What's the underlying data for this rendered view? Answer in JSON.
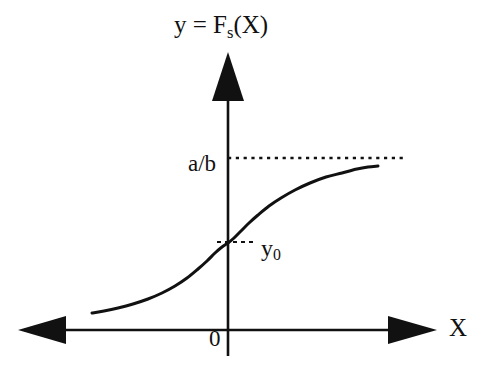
{
  "figure": {
    "kind": "math-function-sketch",
    "background_color": "#ffffff",
    "ink_color": "#111111"
  },
  "labels": {
    "axis_title_prefix": "y = F",
    "axis_title_subscript": "s",
    "axis_title_suffix": "(X)",
    "asymptote": "a/b",
    "intercept_prefix": "y",
    "intercept_subscript": "0",
    "origin": "0",
    "x_axis": "X"
  },
  "chart_data": {
    "type": "line",
    "title": "y = Fs(X)",
    "xlabel": "X",
    "ylabel": "y = Fs(X)",
    "grid": false,
    "legend": null,
    "axes": {
      "origin_px": {
        "x": 228,
        "y": 330
      },
      "x_axis_y_px": 330,
      "y_axis_x_px": 228,
      "x_axis_left_end_px": 22,
      "x_axis_right_end_px": 432,
      "y_axis_top_end_px": 55,
      "y_axis_bottom_end_px": 356,
      "x_arrows": [
        "left",
        "right"
      ],
      "y_arrows": [
        "up"
      ]
    },
    "annotations": [
      {
        "name": "asymptote",
        "label": "a/b",
        "style": "dotted-horizontal",
        "y_px": 158,
        "x_start_px": 228,
        "x_end_px": 407
      },
      {
        "name": "y-intercept",
        "label": "y0",
        "style": "dashed-tick",
        "y_px": 242,
        "x_start_px": 218,
        "x_end_px": 253
      },
      {
        "name": "origin",
        "label": "0",
        "style": "point",
        "x_px": 228,
        "y_px": 330
      }
    ],
    "series": [
      {
        "name": "Fs(X)",
        "description": "Monotonically increasing sigmoid-like saturating curve passing through y0 at X=0 and approaching the asymptote a/b as X increases",
        "color": "#111111",
        "linewidth": 3,
        "points_px": [
          [
            92,
            313
          ],
          [
            104,
            311
          ],
          [
            118,
            308
          ],
          [
            133,
            304
          ],
          [
            148,
            299
          ],
          [
            162,
            293
          ],
          [
            175,
            286
          ],
          [
            187,
            278
          ],
          [
            198,
            269
          ],
          [
            207,
            261
          ],
          [
            215,
            253
          ],
          [
            222,
            247
          ],
          [
            228,
            243
          ],
          [
            234,
            238
          ],
          [
            241,
            231
          ],
          [
            249,
            223
          ],
          [
            258,
            215
          ],
          [
            269,
            206
          ],
          [
            281,
            198
          ],
          [
            295,
            190
          ],
          [
            310,
            183
          ],
          [
            326,
            177
          ],
          [
            342,
            173
          ],
          [
            357,
            169
          ],
          [
            368,
            167
          ],
          [
            378,
            166
          ]
        ]
      }
    ]
  }
}
